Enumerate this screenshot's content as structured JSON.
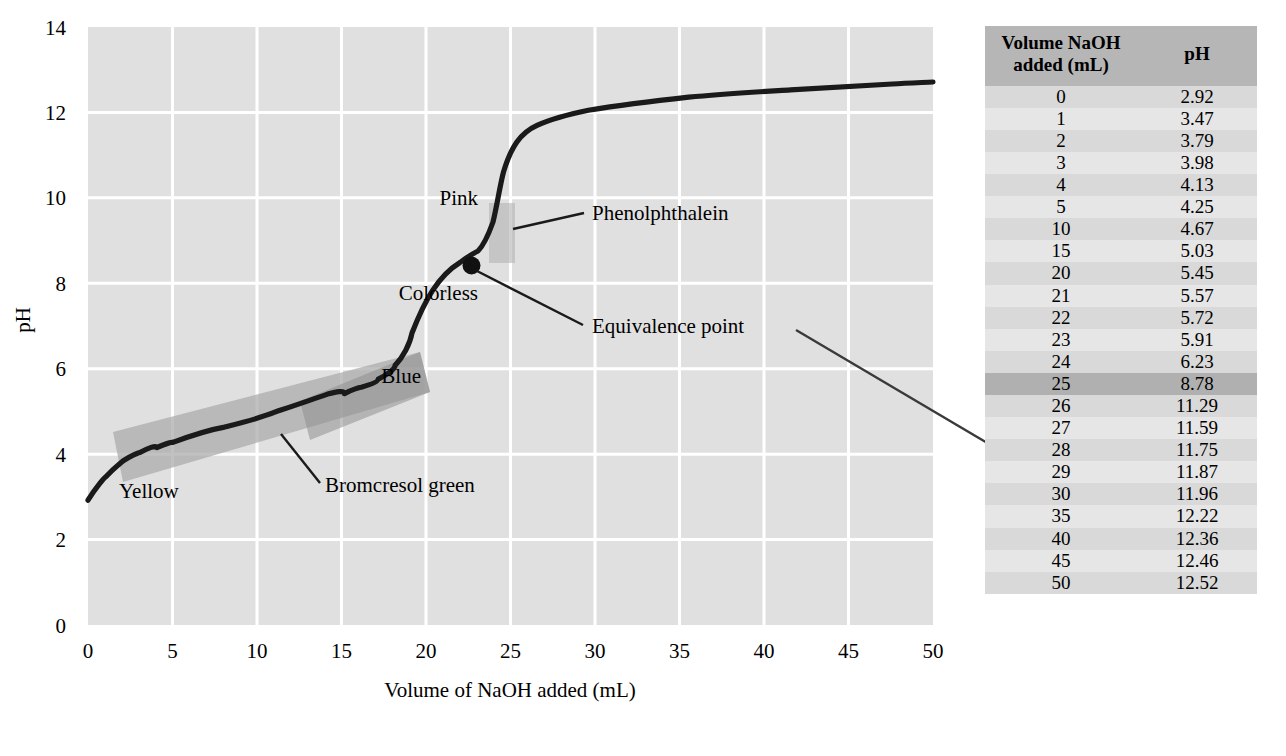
{
  "chart_data": {
    "type": "line",
    "title": "",
    "xlabel": "Volume of NaOH added (mL)",
    "ylabel": "pH",
    "xlim": [
      0,
      50
    ],
    "ylim": [
      0,
      14
    ],
    "xticks": [
      0,
      5,
      10,
      15,
      20,
      25,
      30,
      35,
      40,
      45,
      50
    ],
    "yticks": [
      0,
      2,
      4,
      6,
      8,
      10,
      12,
      14
    ],
    "grid": true,
    "legend": "none",
    "series": [
      {
        "name": "Titration curve",
        "x": [
          0,
          1,
          2,
          3,
          4,
          5,
          10,
          15,
          20,
          21,
          22,
          23,
          24,
          25,
          26,
          27,
          28,
          29,
          30,
          35,
          40,
          45,
          50
        ],
        "values": [
          2.92,
          3.47,
          3.79,
          3.98,
          4.13,
          4.25,
          4.67,
          5.03,
          5.45,
          5.57,
          5.72,
          5.91,
          6.23,
          8.78,
          11.29,
          11.59,
          11.75,
          11.87,
          11.96,
          12.22,
          12.36,
          12.46,
          12.52
        ]
      }
    ],
    "annotations": [
      {
        "name": "equivalence-point",
        "label": "Equivalence point",
        "x": 25,
        "y": 8.78
      },
      {
        "name": "phenolphthalein",
        "label": "Phenolphthalein",
        "range_ph": [
          8.3,
          10.0
        ]
      },
      {
        "name": "bromcresol-green",
        "label": "Bromcresol green",
        "range_ph": [
          3.8,
          5.4
        ]
      },
      {
        "name": "pink",
        "label": "Pink"
      },
      {
        "name": "colorless",
        "label": "Colorless"
      },
      {
        "name": "blue",
        "label": "Blue"
      },
      {
        "name": "yellow",
        "label": "Yellow"
      }
    ]
  },
  "axes": {
    "ylabel": "pH",
    "xlabel": "Volume of NaOH added (mL)",
    "xticks": [
      "0",
      "5",
      "10",
      "15",
      "20",
      "25",
      "30",
      "35",
      "40",
      "45",
      "50"
    ],
    "yticks": [
      "0",
      "2",
      "4",
      "6",
      "8",
      "10",
      "12",
      "14"
    ]
  },
  "labels": {
    "pink": "Pink",
    "colorless": "Colorless",
    "blue": "Blue",
    "yellow": "Yellow",
    "phenolphthalein": "Phenolphthalein",
    "bromcresol_green": "Bromcresol green",
    "equivalence_point": "Equivalence point"
  },
  "table": {
    "headers": {
      "volume": "Volume NaOH\nadded (mL)",
      "volume_line1": "Volume NaOH",
      "volume_line2": "added (mL)",
      "ph": "pH"
    },
    "rows": [
      {
        "volume": "0",
        "ph": "2.92",
        "highlight": false
      },
      {
        "volume": "1",
        "ph": "3.47",
        "highlight": false
      },
      {
        "volume": "2",
        "ph": "3.79",
        "highlight": false
      },
      {
        "volume": "3",
        "ph": "3.98",
        "highlight": false
      },
      {
        "volume": "4",
        "ph": "4.13",
        "highlight": false
      },
      {
        "volume": "5",
        "ph": "4.25",
        "highlight": false
      },
      {
        "volume": "10",
        "ph": "4.67",
        "highlight": false
      },
      {
        "volume": "15",
        "ph": "5.03",
        "highlight": false
      },
      {
        "volume": "20",
        "ph": "5.45",
        "highlight": false
      },
      {
        "volume": "21",
        "ph": "5.57",
        "highlight": false
      },
      {
        "volume": "22",
        "ph": "5.72",
        "highlight": false
      },
      {
        "volume": "23",
        "ph": "5.91",
        "highlight": false
      },
      {
        "volume": "24",
        "ph": "6.23",
        "highlight": false
      },
      {
        "volume": "25",
        "ph": "8.78",
        "highlight": true
      },
      {
        "volume": "26",
        "ph": "11.29",
        "highlight": false
      },
      {
        "volume": "27",
        "ph": "11.59",
        "highlight": false
      },
      {
        "volume": "28",
        "ph": "11.75",
        "highlight": false
      },
      {
        "volume": "29",
        "ph": "11.87",
        "highlight": false
      },
      {
        "volume": "30",
        "ph": "11.96",
        "highlight": false
      },
      {
        "volume": "35",
        "ph": "12.22",
        "highlight": false
      },
      {
        "volume": "40",
        "ph": "12.36",
        "highlight": false
      },
      {
        "volume": "45",
        "ph": "12.46",
        "highlight": false
      },
      {
        "volume": "50",
        "ph": "12.52",
        "highlight": false
      }
    ]
  },
  "colors": {
    "plot_background": "#e0e0e0",
    "gridline": "#ffffff",
    "curve": "#1a1a1a",
    "table_header": "#b6b6b6",
    "table_row": "#d9d9d9",
    "table_row_alt": "#e6e6e6",
    "table_row_highlight": "#b0b0b0",
    "indicator_band": "#a8a8a8"
  }
}
